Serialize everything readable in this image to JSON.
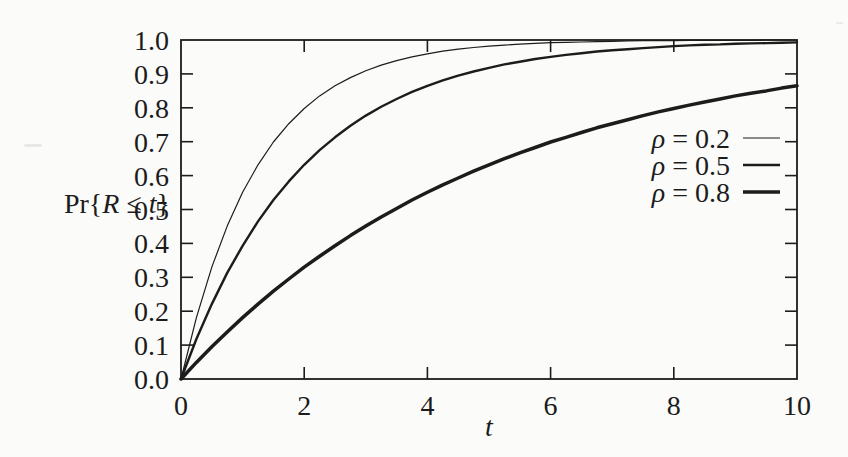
{
  "colors": {
    "ink": "#1c1c1c",
    "paper": "#fbfbf9"
  },
  "chart_data": {
    "type": "line",
    "title": "",
    "xlabel": "t",
    "ylabel": "Pr{R ≤ t}",
    "xlim": [
      0,
      10
    ],
    "ylim": [
      0.0,
      1.0
    ],
    "grid": false,
    "x_ticks": [
      0,
      2,
      4,
      6,
      8,
      10
    ],
    "x_tick_labels": [
      "0",
      "2",
      "4",
      "6",
      "8",
      "10"
    ],
    "y_ticks": [
      0.0,
      0.1,
      0.2,
      0.3,
      0.4,
      0.5,
      0.6,
      0.7,
      0.8,
      0.9,
      1.0
    ],
    "y_tick_labels": [
      "0.0",
      "0.1",
      "0.2",
      "0.3",
      "0.4",
      "0.5",
      "0.6",
      "0.7",
      "0.8",
      "0.9",
      "1.0"
    ],
    "legend": {
      "position": "inside-right"
    },
    "x": [
      0,
      0.25,
      0.5,
      0.75,
      1,
      1.25,
      1.5,
      1.75,
      2,
      2.25,
      2.5,
      2.75,
      3,
      3.25,
      3.5,
      3.75,
      4,
      4.25,
      4.5,
      4.75,
      5,
      5.25,
      5.5,
      5.75,
      6,
      6.25,
      6.5,
      6.75,
      7,
      7.25,
      7.5,
      7.75,
      8,
      8.25,
      8.5,
      8.75,
      9,
      9.25,
      9.5,
      9.75,
      10
    ],
    "series": [
      {
        "name": "ρ = 0.2",
        "line_width": 1.2,
        "values": [
          0,
          0.181,
          0.33,
          0.451,
          0.551,
          0.632,
          0.699,
          0.753,
          0.798,
          0.835,
          0.865,
          0.889,
          0.909,
          0.926,
          0.939,
          0.95,
          0.959,
          0.967,
          0.973,
          0.978,
          0.982,
          0.985,
          0.988,
          0.99,
          0.992,
          0.993,
          0.994,
          0.995,
          0.996,
          0.997,
          0.998,
          0.998,
          0.998,
          0.999,
          0.999,
          0.999,
          0.999,
          0.999,
          1,
          1,
          1
        ]
      },
      {
        "name": "ρ = 0.5",
        "line_width": 2.4,
        "values": [
          0,
          0.118,
          0.221,
          0.313,
          0.393,
          0.465,
          0.528,
          0.583,
          0.632,
          0.675,
          0.713,
          0.747,
          0.777,
          0.803,
          0.826,
          0.847,
          0.865,
          0.881,
          0.895,
          0.907,
          0.918,
          0.928,
          0.936,
          0.944,
          0.95,
          0.956,
          0.961,
          0.966,
          0.97,
          0.973,
          0.976,
          0.979,
          0.982,
          0.984,
          0.986,
          0.987,
          0.989,
          0.99,
          0.991,
          0.992,
          0.993
        ]
      },
      {
        "name": "ρ = 0.8",
        "line_width": 3.5,
        "values": [
          0,
          0.049,
          0.095,
          0.139,
          0.181,
          0.221,
          0.259,
          0.295,
          0.33,
          0.362,
          0.393,
          0.423,
          0.451,
          0.478,
          0.503,
          0.528,
          0.551,
          0.573,
          0.593,
          0.613,
          0.632,
          0.65,
          0.667,
          0.683,
          0.699,
          0.713,
          0.727,
          0.741,
          0.753,
          0.765,
          0.777,
          0.788,
          0.798,
          0.808,
          0.817,
          0.826,
          0.835,
          0.843,
          0.85,
          0.858,
          0.865
        ]
      }
    ]
  }
}
